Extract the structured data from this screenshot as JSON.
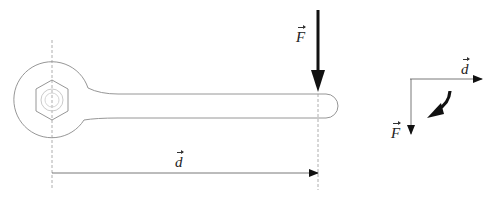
{
  "diagram": {
    "colors": {
      "outline": "#8a8a8a",
      "dashed_axis": "#9a9a9a",
      "arrow": "#111111",
      "thin_arrow": "#555555"
    },
    "wrench": {
      "pivot": {
        "x": 52,
        "y": 100
      },
      "head_radius": 38,
      "nut_radius": 18,
      "handle": {
        "top_y": 94,
        "bottom_y": 118,
        "end_x": 338
      }
    },
    "labels": {
      "force_main": "F",
      "distance_main": "d",
      "distance_side": "d",
      "force_side": "F"
    },
    "arrows": {
      "force": {
        "x": 318,
        "y_start": 10,
        "y_end": 92,
        "label": "F"
      },
      "distance": {
        "y": 173,
        "x_start": 52,
        "x_end": 318,
        "label": "d"
      },
      "side_distance": {
        "y": 79,
        "x_start": 410,
        "x_end": 482,
        "label": "d"
      },
      "side_force": {
        "x": 411,
        "y_start": 79,
        "y_end": 134,
        "label": "F"
      },
      "rotation": {
        "direction": "clockwise",
        "description": "curved bold arrow"
      }
    }
  }
}
